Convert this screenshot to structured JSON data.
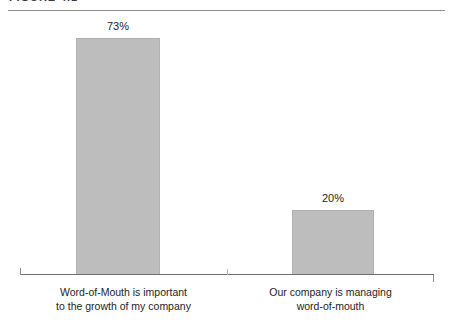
{
  "figure": {
    "title": "FIGURE 4.1",
    "background_color": "#ffffff"
  },
  "colors": {
    "bar_fill": "#bdbdbd",
    "bar_border": "#b2b2b2",
    "axis": "#6f6f6f",
    "rule": "#8d8d8d",
    "text": "#1d1d1d",
    "title_text": "#3b3b3b"
  },
  "chart_data": {
    "type": "bar",
    "title": "FIGURE 4.1",
    "subtitle": "",
    "xlabel": "",
    "ylabel": "",
    "categories": [
      "Word-of-Mouth is important to the growth of my company",
      "Our company is managing word-of-mouth"
    ],
    "category_lines": [
      [
        "Word-of-Mouth is important",
        "to the growth of my company"
      ],
      [
        "Our company is managing",
        "word-of-mouth"
      ]
    ],
    "values": [
      73,
      20
    ],
    "value_labels": [
      "73%",
      "20%"
    ],
    "unit": "%",
    "ylim": [
      0,
      85
    ],
    "grid": false,
    "legend": null,
    "axis_tick_labels": [],
    "series": [
      {
        "name": "Percent of respondents",
        "values": [
          73,
          20
        ]
      }
    ]
  }
}
